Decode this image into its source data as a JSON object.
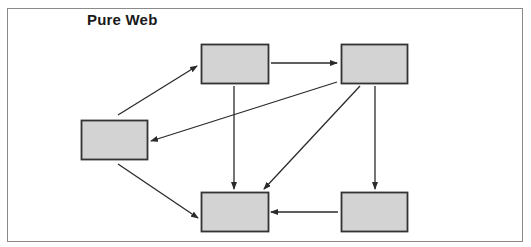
{
  "diagram": {
    "title": "Pure Web",
    "colors": {
      "node_fill": "#d3d3d3",
      "node_stroke": "#333333",
      "edge": "#2a2a2a"
    },
    "nodes": [
      {
        "id": "top-middle",
        "label": ""
      },
      {
        "id": "top-right",
        "label": ""
      },
      {
        "id": "left",
        "label": ""
      },
      {
        "id": "bottom-middle",
        "label": ""
      },
      {
        "id": "bottom-right",
        "label": ""
      }
    ],
    "edges": [
      {
        "from": "left",
        "to": "top-middle"
      },
      {
        "from": "top-middle",
        "to": "top-right"
      },
      {
        "from": "top-right",
        "to": "left"
      },
      {
        "from": "top-middle",
        "to": "bottom-middle"
      },
      {
        "from": "top-right",
        "to": "bottom-middle"
      },
      {
        "from": "top-right",
        "to": "bottom-right"
      },
      {
        "from": "left",
        "to": "bottom-middle"
      },
      {
        "from": "bottom-right",
        "to": "bottom-middle"
      }
    ]
  }
}
